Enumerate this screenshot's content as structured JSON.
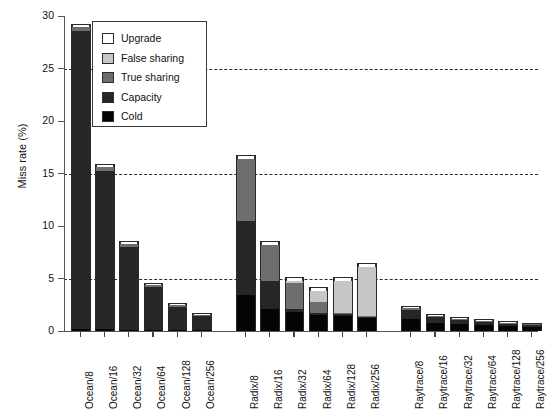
{
  "chart_data": {
    "type": "bar",
    "title": "",
    "xlabel": "",
    "ylabel": "Miss rate (%)",
    "ylim": [
      0,
      30
    ],
    "yticks": [
      0,
      5,
      10,
      15,
      20,
      25,
      30
    ],
    "ytick_labels": [
      "0",
      "5",
      "10",
      "15",
      "20",
      "25",
      "30"
    ],
    "grid": "horizontal dashed at 5, 15, 25",
    "gridlines": [
      5,
      15,
      25
    ],
    "legend_position": "upper-left inside plot",
    "stacked": true,
    "stack_order_bottom_to_top": [
      "Cold",
      "Capacity",
      "True sharing",
      "False sharing",
      "Upgrade"
    ],
    "legend_order_top_to_bottom": [
      "Upgrade",
      "False sharing",
      "True sharing",
      "Capacity",
      "Cold"
    ],
    "categories": [
      "Ocean/8",
      "Ocean/16",
      "Ocean/32",
      "Ocean/64",
      "Ocean/128",
      "Ocean/256",
      "Radix/8",
      "Radix/16",
      "Radix/32",
      "Radix/64",
      "Radix/128",
      "Radix/256",
      "Raytrace/8",
      "Raytrace/16",
      "Raytrace/32",
      "Raytrace/64",
      "Raytrace/128",
      "Raytrace/256"
    ],
    "group_gaps_after": [
      "Ocean/256",
      "Radix/256"
    ],
    "series": [
      {
        "name": "Cold",
        "color": "#050505",
        "values": [
          0.2,
          0.15,
          0.12,
          0.1,
          0.08,
          0.06,
          3.4,
          2.1,
          1.8,
          1.5,
          1.4,
          1.2,
          1.1,
          0.8,
          0.7,
          0.6,
          0.5,
          0.4
        ]
      },
      {
        "name": "Capacity",
        "color": "#262626",
        "values": [
          28.4,
          15.1,
          7.85,
          4.05,
          2.25,
          1.35,
          7.1,
          2.7,
          0.3,
          0.25,
          0.2,
          0.15,
          0.9,
          0.55,
          0.35,
          0.28,
          0.22,
          0.18
        ]
      },
      {
        "name": "True sharing",
        "color": "#6e6e6e",
        "values": [
          0.4,
          0.4,
          0.35,
          0.2,
          0.15,
          0.1,
          5.9,
          3.4,
          2.45,
          1.0,
          0.1,
          0.08,
          0.15,
          0.1,
          0.08,
          0.06,
          0.05,
          0.04
        ]
      },
      {
        "name": "False sharing",
        "color": "#c6c6c6",
        "values": [
          0.0,
          0.0,
          0.0,
          0.0,
          0.0,
          0.0,
          0.0,
          0.0,
          0.25,
          1.05,
          3.1,
          4.7,
          0.0,
          0.0,
          0.0,
          0.0,
          0.0,
          0.0
        ]
      },
      {
        "name": "Upgrade",
        "color": "#ffffff",
        "values": [
          0.15,
          0.15,
          0.15,
          0.15,
          0.12,
          0.1,
          0.3,
          0.3,
          0.25,
          0.25,
          0.25,
          0.25,
          0.1,
          0.1,
          0.1,
          0.1,
          0.08,
          0.08
        ]
      }
    ],
    "totals": [
      29.15,
      15.8,
      8.47,
      4.5,
      2.6,
      1.61,
      16.7,
      8.5,
      5.05,
      4.05,
      5.05,
      6.38,
      2.25,
      1.55,
      1.23,
      1.04,
      0.85,
      0.7
    ]
  },
  "legend": {
    "items": [
      {
        "label": "Upgrade",
        "color": "#ffffff"
      },
      {
        "label": "False sharing",
        "color": "#c6c6c6"
      },
      {
        "label": "True sharing",
        "color": "#6e6e6e"
      },
      {
        "label": "Capacity",
        "color": "#262626"
      },
      {
        "label": "Cold",
        "color": "#050505"
      }
    ]
  }
}
